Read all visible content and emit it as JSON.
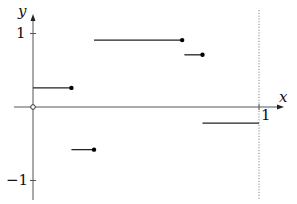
{
  "chart_data": {
    "type": "line",
    "subtype": "step-function",
    "title": "",
    "xlabel": "x",
    "ylabel": "y",
    "xlim": [
      -0.08,
      1.15
    ],
    "ylim": [
      -1.25,
      1.45
    ],
    "x_ticks": [
      {
        "value": 1,
        "label": "1"
      }
    ],
    "y_ticks": [
      {
        "value": 1,
        "label": "1"
      },
      {
        "value": -1,
        "label": "-1"
      }
    ],
    "grid": false,
    "vertical_reference_line": {
      "x": 1,
      "style": "dotted"
    },
    "origin_marker": {
      "x": 0,
      "y": 0,
      "style": "open-circle"
    },
    "segments": [
      {
        "x_start": 0.0,
        "x_end": 0.17,
        "y": 0.26,
        "end_marker": "filled"
      },
      {
        "x_start": 0.17,
        "x_end": 0.27,
        "y": -0.58,
        "end_marker": "filled"
      },
      {
        "x_start": 0.27,
        "x_end": 0.66,
        "y": 0.91,
        "end_marker": "filled"
      },
      {
        "x_start": 0.67,
        "x_end": 0.75,
        "y": 0.71,
        "end_marker": "filled"
      },
      {
        "x_start": 0.75,
        "x_end": 1.0,
        "y": -0.22,
        "end_marker": "none"
      }
    ]
  },
  "labels": {
    "x_axis": "x",
    "y_axis": "y",
    "x_tick_1": "1",
    "y_tick_pos1": "1",
    "y_tick_neg1": "−1"
  },
  "colors": {
    "axis": "#555555",
    "segment": "#222222",
    "dotted": "#888888"
  }
}
